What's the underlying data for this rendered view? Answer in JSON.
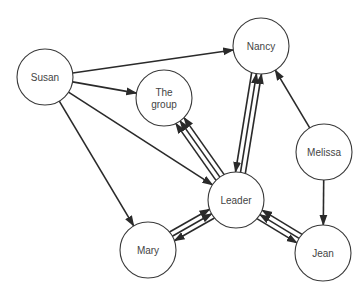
{
  "diagram": {
    "type": "sociogram",
    "nodes": [
      {
        "id": "susan",
        "label": "Susan",
        "cx": 45,
        "cy": 77,
        "r": 28
      },
      {
        "id": "group",
        "label_lines": [
          "The",
          "group"
        ],
        "cx": 164,
        "cy": 98,
        "r": 28
      },
      {
        "id": "nancy",
        "label": "Nancy",
        "cx": 261,
        "cy": 46,
        "r": 28
      },
      {
        "id": "melissa",
        "label": "Melissa",
        "cx": 324,
        "cy": 152,
        "r": 28
      },
      {
        "id": "leader",
        "label": "Leader",
        "cx": 236,
        "cy": 200,
        "r": 28
      },
      {
        "id": "mary",
        "label": "Mary",
        "cx": 148,
        "cy": 250,
        "r": 28
      },
      {
        "id": "jean",
        "label": "Jean",
        "cx": 323,
        "cy": 253,
        "r": 28
      }
    ],
    "edges": [
      {
        "from": "susan",
        "to": "nancy",
        "count": 1
      },
      {
        "from": "susan",
        "to": "group",
        "count": 1
      },
      {
        "from": "susan",
        "to": "leader",
        "count": 1
      },
      {
        "from": "susan",
        "to": "mary",
        "count": 1
      },
      {
        "from": "melissa",
        "to": "nancy",
        "count": 1
      },
      {
        "from": "melissa",
        "to": "jean",
        "count": 1
      },
      {
        "from": "leader",
        "to": "group",
        "count": 3
      },
      {
        "from": "nancy",
        "to": "leader",
        "count": 1
      },
      {
        "from": "leader",
        "to": "nancy",
        "count": 2
      },
      {
        "from": "leader",
        "to": "mary",
        "count": 1
      },
      {
        "from": "mary",
        "to": "leader",
        "count": 2
      },
      {
        "from": "leader",
        "to": "jean",
        "count": 1
      },
      {
        "from": "jean",
        "to": "leader",
        "count": 2
      }
    ]
  }
}
